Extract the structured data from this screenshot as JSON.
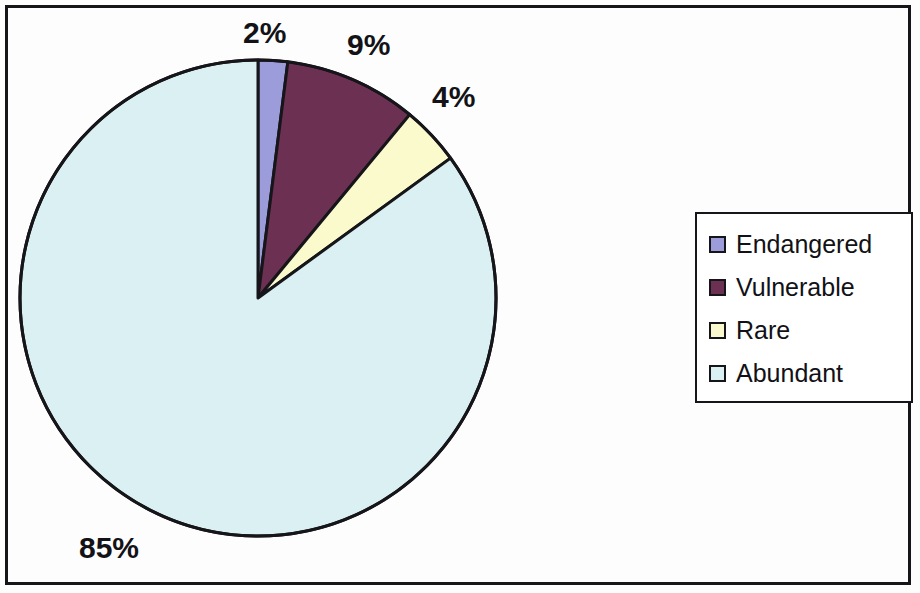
{
  "chart_data": {
    "type": "pie",
    "title": "",
    "categories": [
      "Endangered",
      "Vulnerable",
      "Rare",
      "Abundant"
    ],
    "values": [
      2,
      9,
      4,
      85
    ],
    "value_unit": "%",
    "data_labels": [
      "2%",
      "9%",
      "4%",
      "85%"
    ],
    "colors": [
      "#9c9cdb",
      "#6b3052",
      "#fafacd",
      "#dbf0f2"
    ],
    "slice_start_angle_deg": 0,
    "slice_direction": "clockwise",
    "legend": {
      "position": "right",
      "entries": [
        {
          "label": "Endangered",
          "color": "#9c9cdb",
          "value": 2,
          "data_label": "2%"
        },
        {
          "label": "Vulnerable",
          "color": "#6b3052",
          "value": 9,
          "data_label": "9%"
        },
        {
          "label": "Rare",
          "color": "#fafacd",
          "value": 4,
          "data_label": "4%"
        },
        {
          "label": "Abundant",
          "color": "#dbf0f2",
          "value": 85,
          "data_label": "85%"
        }
      ]
    },
    "grid": false,
    "xlabel": "",
    "ylabel": ""
  },
  "labels": {
    "endangered_pct": "2%",
    "vulnerable_pct": "9%",
    "rare_pct": "4%",
    "abundant_pct": "85%"
  },
  "legend": {
    "items": [
      {
        "label": "Endangered"
      },
      {
        "label": "Vulnerable"
      },
      {
        "label": "Rare"
      },
      {
        "label": "Abundant"
      }
    ]
  },
  "background_bleed": {
    "lines": [
      "of the total",
      "and",
      "conservation programme",
      "particular habitat",
      "2002 Annual Report, section",
      "Wildlife Trust of India",
      "for a new reserve in the",
      "the species Oryx",
      "for"
    ]
  }
}
